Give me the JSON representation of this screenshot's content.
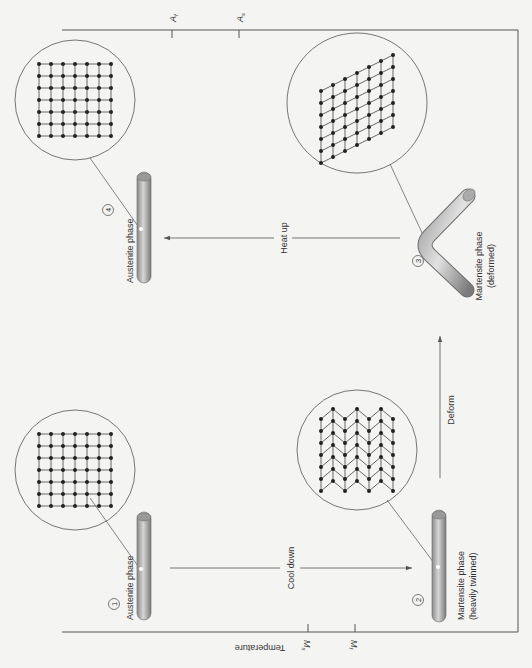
{
  "figure": {
    "orientation": "rotated-90-clockwise",
    "axis": {
      "label": "Temperature",
      "bottom_ticks": [
        {
          "id": "Ms",
          "label": "M",
          "sub": "s"
        },
        {
          "id": "Mf",
          "label": "M",
          "sub": "f"
        }
      ],
      "top_ticks": [
        {
          "id": "Af",
          "label": "A",
          "sub": "f"
        },
        {
          "id": "As",
          "label": "A",
          "sub": "s"
        }
      ]
    },
    "stages": [
      {
        "number": "1",
        "label": "Austenite phase",
        "sublabel": "",
        "lattice": "square"
      },
      {
        "number": "2",
        "label": "Martensite phase",
        "sublabel": "(heavily twinned)",
        "lattice": "twinned"
      },
      {
        "number": "3",
        "label": "Martensite phase",
        "sublabel": "(deformed)",
        "lattice": "sheared"
      },
      {
        "number": "4",
        "label": "Austenite phase",
        "sublabel": "",
        "lattice": "square"
      }
    ],
    "transitions": [
      {
        "id": "cool",
        "label": "Cool down",
        "from": "1",
        "to": "2"
      },
      {
        "id": "deform",
        "label": "Deform",
        "from": "2",
        "to": "3"
      },
      {
        "id": "heat",
        "label": "Heat up",
        "from": "3",
        "to": "4"
      }
    ],
    "colors": {
      "background": "#f4f4f2",
      "line": "#555555",
      "rod_dark": "#7d7d7d",
      "rod_light": "#d8d8d8",
      "atom": "#222222"
    }
  }
}
